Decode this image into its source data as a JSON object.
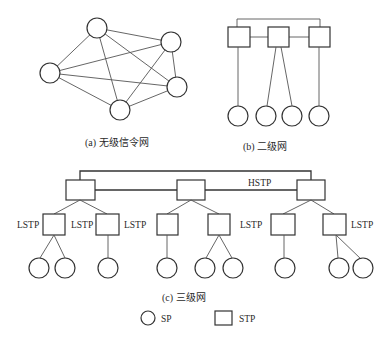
{
  "diagram_a": {
    "caption": "(a) 无级信令网",
    "nodes": [
      {
        "id": "n1",
        "type": "SP",
        "x": 97,
        "y": 28
      },
      {
        "id": "n2",
        "type": "SP",
        "x": 171,
        "y": 42
      },
      {
        "id": "n3",
        "type": "SP",
        "x": 50,
        "y": 73
      },
      {
        "id": "n4",
        "type": "SP",
        "x": 177,
        "y": 87
      },
      {
        "id": "n5",
        "type": "SP",
        "x": 120,
        "y": 110
      }
    ],
    "edges": [
      [
        "n1",
        "n2"
      ],
      [
        "n1",
        "n3"
      ],
      [
        "n1",
        "n4"
      ],
      [
        "n1",
        "n5"
      ],
      [
        "n2",
        "n3"
      ],
      [
        "n2",
        "n4"
      ],
      [
        "n2",
        "n5"
      ],
      [
        "n3",
        "n4"
      ],
      [
        "n3",
        "n5"
      ],
      [
        "n4",
        "n5"
      ]
    ]
  },
  "diagram_b": {
    "caption": "(b) 二级网",
    "stps": 3,
    "sps": 4
  },
  "diagram_c": {
    "caption": "(c) 三级网",
    "hstp_label": "HSTP",
    "lstp_label": "LSTP",
    "lstp_labels": [
      "LSTP",
      "LSTP",
      "LSTP",
      "LSTP",
      "LSTP"
    ]
  },
  "legend": {
    "sp_label": "SP",
    "stp_label": "STP"
  }
}
